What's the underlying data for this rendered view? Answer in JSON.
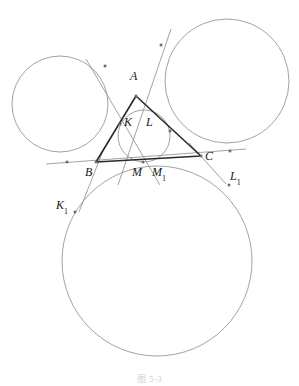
{
  "figure": {
    "caption": "图 5-3",
    "width": 299,
    "height": 386,
    "background": "#ffffff",
    "stroke_thin": "#8a8a8a",
    "stroke_thick": "#2a2a2a",
    "marker_color": "#6b6b6b",
    "label_color": "#1a1a1a"
  },
  "labels": {
    "A": "A",
    "B": "B",
    "C": "C",
    "K": "K",
    "L": "L",
    "M": "M",
    "M1_base": "M",
    "M1_sub": "1",
    "K1_base": "K",
    "K1_sub": "1",
    "L1_base": "L",
    "L1_sub": "1"
  },
  "geometry": {
    "triangle": {
      "A": [
        136,
        96
      ],
      "B": [
        96,
        162
      ],
      "C": [
        201,
        156
      ],
      "stroke": "#2a2a2a",
      "stroke_width": 1.6
    },
    "incircle": {
      "cx": 144,
      "cy": 136,
      "r": 26,
      "stroke": "#8a8a8a",
      "stroke_width": 0.8
    },
    "circles": [
      {
        "name": "left-circle",
        "cx": 60,
        "cy": 104,
        "r": 48,
        "stroke": "#8a8a8a",
        "stroke_width": 0.8
      },
      {
        "name": "right-circle",
        "cx": 227,
        "cy": 81,
        "r": 62,
        "stroke": "#8a8a8a",
        "stroke_width": 0.8
      },
      {
        "name": "bottom-circle",
        "cx": 157,
        "cy": 261,
        "r": 95,
        "stroke": "#8a8a8a",
        "stroke_width": 0.8
      }
    ],
    "tangent_lines": [
      {
        "name": "line-through-A-upper-left",
        "x1": 86,
        "y1": 59,
        "x2": 160,
        "y2": 185
      },
      {
        "name": "line-through-A-upper-right",
        "x1": 171,
        "y1": 29,
        "x2": 118,
        "y2": 185
      },
      {
        "name": "line-base-extended",
        "x1": 46,
        "y1": 164,
        "x2": 246,
        "y2": 149
      },
      {
        "name": "line-B-to-K1",
        "x1": 104,
        "y1": 148,
        "x2": 79,
        "y2": 212
      },
      {
        "name": "line-C-to-L1",
        "x1": 189,
        "y1": 143,
        "x2": 226,
        "y2": 184
      }
    ],
    "markers": [
      {
        "name": "point-A",
        "x": 136,
        "y": 96
      },
      {
        "name": "point-B",
        "x": 96,
        "y": 162
      },
      {
        "name": "point-C",
        "x": 201,
        "y": 156
      },
      {
        "name": "point-K",
        "x": 120,
        "y": 124
      },
      {
        "name": "point-M",
        "x": 143,
        "y": 162
      },
      {
        "name": "point-L",
        "x": 170,
        "y": 131
      },
      {
        "name": "point-upper-left",
        "x": 105,
        "y": 66
      },
      {
        "name": "point-upper-right",
        "x": 161,
        "y": 45
      },
      {
        "name": "point-left-base",
        "x": 67,
        "y": 162
      },
      {
        "name": "point-right-base",
        "x": 230,
        "y": 151
      },
      {
        "name": "point-K1",
        "x": 75,
        "y": 212
      },
      {
        "name": "point-L1",
        "x": 229,
        "y": 185
      }
    ],
    "label_positions": {
      "A": {
        "x": 130,
        "y": 70
      },
      "B": {
        "x": 85,
        "y": 166
      },
      "C": {
        "x": 205,
        "y": 150
      },
      "K": {
        "x": 124,
        "y": 116
      },
      "L": {
        "x": 146,
        "y": 116
      },
      "M": {
        "x": 132,
        "y": 166
      },
      "M1": {
        "x": 152,
        "y": 166
      },
      "K1": {
        "x": 56,
        "y": 199
      },
      "L1": {
        "x": 230,
        "y": 170
      }
    }
  }
}
